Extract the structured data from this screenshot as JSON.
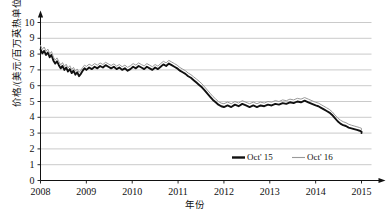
{
  "chart_data": {
    "type": "line",
    "title": "",
    "xlabel": "年份",
    "ylabel": "价格/(美元/百万英热单位)",
    "xlim": [
      2008,
      2015.3
    ],
    "ylim": [
      0,
      10
    ],
    "grid": true,
    "legend_position": "inside-bottom-center",
    "y_ticks": [
      "0",
      "1",
      "2",
      "3",
      "4",
      "5",
      "6",
      "7",
      "8",
      "9",
      "10"
    ],
    "x_ticks": [
      "2008",
      "2009",
      "2010",
      "2011",
      "2012",
      "2013",
      "2014",
      "2015"
    ],
    "series": [
      {
        "name": "Oct' 15",
        "color": "#111111",
        "width": 1.9,
        "x": [
          2008.0,
          2008.04,
          2008.08,
          2008.12,
          2008.16,
          2008.2,
          2008.24,
          2008.28,
          2008.32,
          2008.36,
          2008.4,
          2008.44,
          2008.48,
          2008.52,
          2008.56,
          2008.6,
          2008.64,
          2008.68,
          2008.72,
          2008.76,
          2008.8,
          2008.84,
          2008.88,
          2008.92,
          2008.96,
          2009.0,
          2009.06,
          2009.12,
          2009.18,
          2009.24,
          2009.3,
          2009.36,
          2009.42,
          2009.48,
          2009.54,
          2009.6,
          2009.66,
          2009.72,
          2009.78,
          2009.84,
          2009.9,
          2009.96,
          2010.02,
          2010.08,
          2010.14,
          2010.2,
          2010.26,
          2010.32,
          2010.38,
          2010.44,
          2010.5,
          2010.56,
          2010.62,
          2010.68,
          2010.74,
          2010.8,
          2010.86,
          2010.92,
          2010.98,
          2011.04,
          2011.1,
          2011.16,
          2011.22,
          2011.28,
          2011.34,
          2011.4,
          2011.46,
          2011.52,
          2011.58,
          2011.64,
          2011.7,
          2011.76,
          2011.82,
          2011.88,
          2011.94,
          2012.0,
          2012.08,
          2012.16,
          2012.24,
          2012.32,
          2012.4,
          2012.48,
          2012.56,
          2012.64,
          2012.72,
          2012.8,
          2012.88,
          2012.96,
          2013.04,
          2013.12,
          2013.2,
          2013.28,
          2013.36,
          2013.44,
          2013.52,
          2013.6,
          2013.68,
          2013.76,
          2013.84,
          2013.92,
          2014.0,
          2014.06,
          2014.12,
          2014.18,
          2014.24,
          2014.3,
          2014.36,
          2014.42,
          2014.48,
          2014.54,
          2014.6,
          2014.66,
          2014.72,
          2014.78,
          2014.84,
          2014.9,
          2014.96,
          2015.02,
          2015.08,
          2015.14,
          2015.2
        ],
        "y": [
          8.3,
          8.05,
          8.2,
          7.95,
          8.1,
          7.8,
          7.95,
          7.6,
          7.4,
          7.55,
          7.3,
          7.1,
          7.25,
          7.0,
          7.15,
          6.9,
          7.05,
          6.8,
          6.95,
          6.7,
          6.85,
          6.6,
          6.75,
          6.95,
          7.1,
          7.0,
          7.15,
          7.05,
          7.2,
          7.1,
          7.25,
          7.15,
          7.3,
          7.2,
          7.1,
          7.2,
          7.05,
          7.15,
          7.0,
          7.1,
          6.95,
          7.05,
          7.2,
          7.1,
          7.25,
          7.15,
          7.05,
          7.2,
          7.1,
          7.0,
          7.15,
          7.05,
          7.2,
          7.35,
          7.25,
          7.4,
          7.3,
          7.2,
          7.1,
          6.95,
          6.85,
          6.75,
          6.6,
          6.5,
          6.35,
          6.2,
          6.05,
          5.9,
          5.7,
          5.5,
          5.3,
          5.1,
          4.95,
          4.8,
          4.7,
          4.65,
          4.75,
          4.65,
          4.8,
          4.7,
          4.85,
          4.75,
          4.65,
          4.75,
          4.65,
          4.75,
          4.7,
          4.8,
          4.75,
          4.85,
          4.8,
          4.9,
          4.85,
          4.95,
          4.9,
          5.0,
          4.95,
          5.05,
          4.95,
          4.85,
          4.75,
          4.7,
          4.6,
          4.5,
          4.4,
          4.3,
          4.15,
          3.95,
          3.75,
          3.6,
          3.5,
          3.45,
          3.35,
          3.3,
          3.25,
          3.2,
          3.15,
          3.1,
          3.05,
          3.0,
          3.0
        ]
      },
      {
        "name": "Oct' 16",
        "color": "#9a9a9a",
        "width": 1.0,
        "x": [
          2008.0,
          2008.04,
          2008.08,
          2008.12,
          2008.16,
          2008.2,
          2008.24,
          2008.28,
          2008.32,
          2008.36,
          2008.4,
          2008.44,
          2008.48,
          2008.52,
          2008.56,
          2008.6,
          2008.64,
          2008.68,
          2008.72,
          2008.76,
          2008.8,
          2008.84,
          2008.88,
          2008.92,
          2008.96,
          2009.0,
          2009.06,
          2009.12,
          2009.18,
          2009.24,
          2009.3,
          2009.36,
          2009.42,
          2009.48,
          2009.54,
          2009.6,
          2009.66,
          2009.72,
          2009.78,
          2009.84,
          2009.9,
          2009.96,
          2010.02,
          2010.08,
          2010.14,
          2010.2,
          2010.26,
          2010.32,
          2010.38,
          2010.44,
          2010.5,
          2010.56,
          2010.62,
          2010.68,
          2010.74,
          2010.8,
          2010.86,
          2010.92,
          2010.98,
          2011.04,
          2011.1,
          2011.16,
          2011.22,
          2011.28,
          2011.34,
          2011.4,
          2011.46,
          2011.52,
          2011.58,
          2011.64,
          2011.7,
          2011.76,
          2011.82,
          2011.88,
          2011.94,
          2012.0,
          2012.08,
          2012.16,
          2012.24,
          2012.32,
          2012.4,
          2012.48,
          2012.56,
          2012.64,
          2012.72,
          2012.8,
          2012.88,
          2012.96,
          2013.04,
          2013.12,
          2013.2,
          2013.28,
          2013.36,
          2013.44,
          2013.52,
          2013.6,
          2013.68,
          2013.76,
          2013.84,
          2013.92,
          2014.0,
          2014.06,
          2014.12,
          2014.18,
          2014.24,
          2014.3,
          2014.36,
          2014.42,
          2014.48,
          2014.54,
          2014.6,
          2014.66,
          2014.72,
          2014.78,
          2014.84,
          2014.9,
          2014.96,
          2015.02,
          2015.08,
          2015.14,
          2015.2
        ],
        "y": [
          8.55,
          8.3,
          8.45,
          8.18,
          8.32,
          8.02,
          8.16,
          7.82,
          7.62,
          7.76,
          7.52,
          7.32,
          7.46,
          7.22,
          7.36,
          7.12,
          7.26,
          7.02,
          7.16,
          6.92,
          7.06,
          6.84,
          6.98,
          7.16,
          7.3,
          7.22,
          7.36,
          7.26,
          7.4,
          7.3,
          7.44,
          7.34,
          7.48,
          7.38,
          7.28,
          7.38,
          7.24,
          7.34,
          7.2,
          7.3,
          7.16,
          7.26,
          7.4,
          7.3,
          7.44,
          7.34,
          7.25,
          7.4,
          7.3,
          7.2,
          7.34,
          7.24,
          7.4,
          7.54,
          7.45,
          7.6,
          7.5,
          7.4,
          7.3,
          7.15,
          7.05,
          6.95,
          6.8,
          6.7,
          6.56,
          6.42,
          6.28,
          6.12,
          5.92,
          5.72,
          5.52,
          5.32,
          5.16,
          5.0,
          4.9,
          4.86,
          4.96,
          4.86,
          5.0,
          4.9,
          5.05,
          4.95,
          4.86,
          4.96,
          4.86,
          4.96,
          4.9,
          5.0,
          4.96,
          5.06,
          5.0,
          5.1,
          5.05,
          5.15,
          5.1,
          5.2,
          5.15,
          5.25,
          5.15,
          5.05,
          4.95,
          4.9,
          4.8,
          4.7,
          4.6,
          4.5,
          4.35,
          4.15,
          3.96,
          3.82,
          3.72,
          3.66,
          3.56,
          3.5,
          3.45,
          3.4,
          3.35,
          3.3,
          3.25,
          3.2,
          3.2
        ]
      }
    ]
  },
  "axis": {
    "y_arrow": true,
    "x_arrow": true
  }
}
